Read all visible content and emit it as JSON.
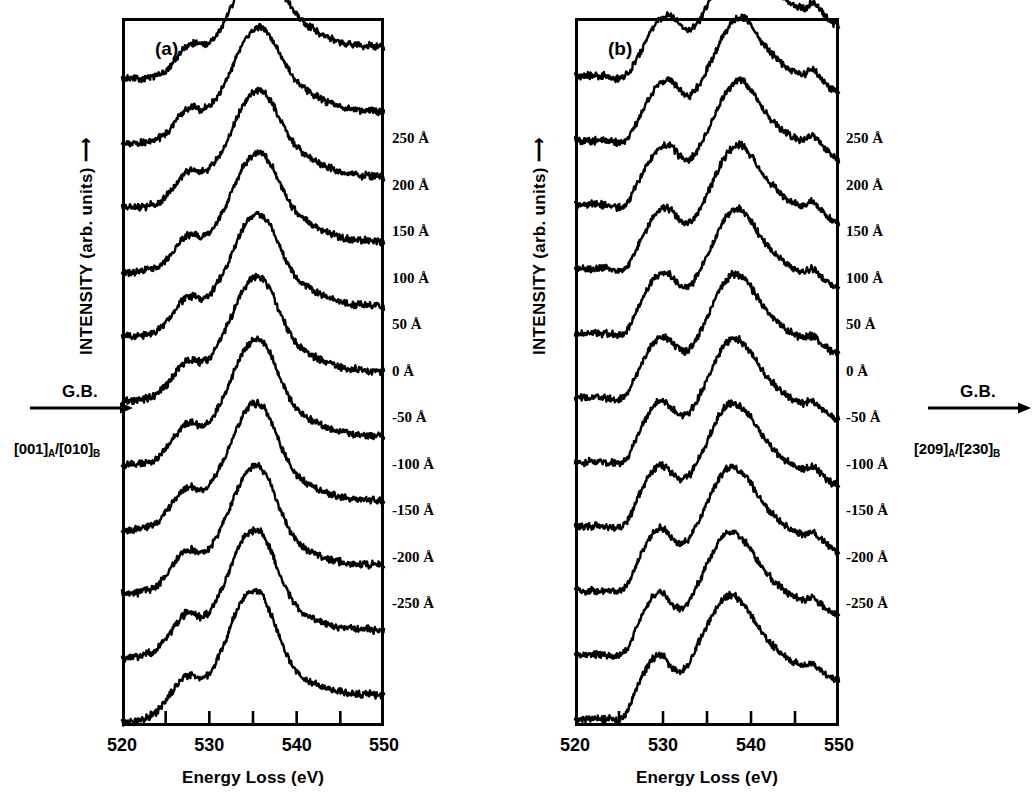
{
  "figure": {
    "type": "eels-spectra-figure",
    "background": "#ffffff",
    "line_color": "#000000"
  },
  "panels": [
    {
      "id": "a",
      "letter": "(a)",
      "y_axis_label": "INTENSITY (arb. units) ⟶",
      "x_axis_title": "Energy Loss  (eV)",
      "gb_label": "G.B.",
      "orientation_prefix": "[001]",
      "orientation_sub_a": "A",
      "orientation_separator": "/",
      "orientation_suffix": "[010]",
      "orientation_sub_b": "B",
      "orientation_full": "[001]A/[010]B",
      "x_tick_labels": [
        "520",
        "530",
        "540",
        "550"
      ],
      "x_tick_label_values": [
        520,
        530,
        540,
        550
      ],
      "x_minor_ticks": [
        525,
        530,
        535,
        540,
        545
      ],
      "depth_labels": [
        "250 Å",
        "200 Å",
        "150 Å",
        "100 Å",
        "50 Å",
        "0 Å",
        "-50 Å",
        "-100 Å",
        "-150 Å",
        "-200 Å",
        "-250 Å"
      ]
    },
    {
      "id": "b",
      "letter": "(b)",
      "y_axis_label": "INTENSITY (arb. units) ⟶",
      "x_axis_title": "Energy Loss  (eV)",
      "gb_label": "G.B.",
      "orientation_prefix": "[209]",
      "orientation_sub_a": "A",
      "orientation_separator": "/",
      "orientation_suffix": "[230]",
      "orientation_sub_b": "B",
      "orientation_full": "[209]A/[230]B",
      "x_tick_labels": [
        "520",
        "530",
        "540",
        "550"
      ],
      "x_tick_label_values": [
        520,
        530,
        540,
        550
      ],
      "x_minor_ticks": [
        525,
        530,
        535,
        540,
        545
      ],
      "depth_labels": [
        "250 Å",
        "200 Å",
        "150 Å",
        "100 Å",
        "50 Å",
        "0 Å",
        "-50 Å",
        "-100 Å",
        "-150 Å",
        "-200 Å",
        "-250 Å"
      ]
    }
  ],
  "chart_data": [
    {
      "type": "line",
      "panel": "a",
      "title": "(a) [001]A/[010]B",
      "xlabel": "Energy Loss  (eV)",
      "ylabel": "INTENSITY (arb. units)",
      "xlim": [
        520,
        550
      ],
      "ylim": [
        0,
        11
      ],
      "grid": false,
      "legend": "right-side depth labels",
      "stacked_offset": true,
      "x": [
        520,
        521,
        522,
        523,
        524,
        525,
        526,
        527,
        528,
        529,
        530,
        531,
        532,
        533,
        534,
        535,
        536,
        537,
        538,
        539,
        540,
        541,
        542,
        543,
        544,
        545,
        546,
        547,
        548,
        549,
        550
      ],
      "series": [
        {
          "name": "250 Å",
          "offset": 10,
          "values": [
            0.05,
            0.06,
            0.05,
            0.07,
            0.1,
            0.18,
            0.34,
            0.52,
            0.6,
            0.58,
            0.62,
            0.78,
            1.02,
            1.32,
            1.62,
            1.82,
            1.9,
            1.78,
            1.52,
            1.26,
            1.06,
            0.92,
            0.82,
            0.74,
            0.68,
            0.63,
            0.6,
            0.58,
            0.57,
            0.56,
            0.55
          ]
        },
        {
          "name": "200 Å",
          "offset": 9,
          "values": [
            0.05,
            0.05,
            0.06,
            0.08,
            0.11,
            0.2,
            0.36,
            0.54,
            0.62,
            0.58,
            0.64,
            0.8,
            1.04,
            1.36,
            1.64,
            1.8,
            1.86,
            1.7,
            1.46,
            1.22,
            1.02,
            0.9,
            0.8,
            0.73,
            0.67,
            0.62,
            0.59,
            0.57,
            0.56,
            0.55,
            0.54
          ]
        },
        {
          "name": "150 Å",
          "offset": 8,
          "values": [
            0.05,
            0.06,
            0.06,
            0.08,
            0.12,
            0.22,
            0.38,
            0.56,
            0.63,
            0.6,
            0.66,
            0.84,
            1.08,
            1.4,
            1.68,
            1.84,
            1.88,
            1.72,
            1.46,
            1.2,
            1.0,
            0.88,
            0.79,
            0.72,
            0.66,
            0.61,
            0.58,
            0.56,
            0.55,
            0.54,
            0.53
          ]
        },
        {
          "name": "100 Å",
          "offset": 7,
          "values": [
            0.05,
            0.05,
            0.06,
            0.09,
            0.13,
            0.24,
            0.4,
            0.58,
            0.64,
            0.6,
            0.66,
            0.86,
            1.12,
            1.44,
            1.72,
            1.88,
            1.9,
            1.74,
            1.46,
            1.18,
            0.98,
            0.86,
            0.77,
            0.7,
            0.65,
            0.6,
            0.57,
            0.55,
            0.54,
            0.53,
            0.52
          ]
        },
        {
          "name": "50 Å",
          "offset": 6,
          "values": [
            0.05,
            0.06,
            0.06,
            0.09,
            0.14,
            0.26,
            0.44,
            0.62,
            0.68,
            0.64,
            0.7,
            0.9,
            1.16,
            1.48,
            1.76,
            1.92,
            1.94,
            1.76,
            1.46,
            1.18,
            0.96,
            0.84,
            0.76,
            0.69,
            0.64,
            0.59,
            0.56,
            0.55,
            0.54,
            0.53,
            0.52
          ]
        },
        {
          "name": "0 Å",
          "offset": 5,
          "values": [
            0.05,
            0.05,
            0.07,
            0.1,
            0.15,
            0.28,
            0.46,
            0.64,
            0.7,
            0.66,
            0.72,
            0.94,
            1.2,
            1.52,
            1.8,
            1.96,
            1.96,
            1.78,
            1.46,
            1.16,
            0.94,
            0.82,
            0.74,
            0.68,
            0.63,
            0.58,
            0.56,
            0.54,
            0.53,
            0.52,
            0.51
          ]
        },
        {
          "name": "-50 Å",
          "offset": 4,
          "values": [
            0.05,
            0.06,
            0.07,
            0.1,
            0.16,
            0.3,
            0.48,
            0.66,
            0.72,
            0.66,
            0.72,
            0.94,
            1.22,
            1.56,
            1.84,
            1.98,
            1.98,
            1.78,
            1.44,
            1.14,
            0.92,
            0.8,
            0.72,
            0.66,
            0.61,
            0.57,
            0.55,
            0.53,
            0.52,
            0.51,
            0.5
          ]
        },
        {
          "name": "-100 Å",
          "offset": 3,
          "values": [
            0.05,
            0.05,
            0.07,
            0.11,
            0.17,
            0.32,
            0.5,
            0.68,
            0.72,
            0.66,
            0.74,
            0.96,
            1.24,
            1.58,
            1.86,
            2.0,
            1.98,
            1.76,
            1.42,
            1.12,
            0.9,
            0.78,
            0.7,
            0.64,
            0.6,
            0.56,
            0.54,
            0.52,
            0.51,
            0.5,
            0.5
          ]
        },
        {
          "name": "-150 Å",
          "offset": 2,
          "values": [
            0.05,
            0.06,
            0.08,
            0.12,
            0.18,
            0.34,
            0.52,
            0.7,
            0.74,
            0.68,
            0.76,
            0.98,
            1.28,
            1.62,
            1.9,
            2.02,
            2.0,
            1.76,
            1.4,
            1.1,
            0.88,
            0.76,
            0.68,
            0.62,
            0.58,
            0.55,
            0.53,
            0.52,
            0.51,
            0.5,
            0.49
          ]
        },
        {
          "name": "-200 Å",
          "offset": 1,
          "values": [
            0.05,
            0.06,
            0.08,
            0.12,
            0.19,
            0.36,
            0.54,
            0.72,
            0.76,
            0.7,
            0.78,
            1.02,
            1.32,
            1.66,
            1.94,
            2.04,
            2.0,
            1.74,
            1.38,
            1.08,
            0.86,
            0.74,
            0.67,
            0.61,
            0.57,
            0.54,
            0.52,
            0.51,
            0.5,
            0.49,
            0.49
          ]
        },
        {
          "name": "-250 Å",
          "offset": 0,
          "values": [
            0.05,
            0.07,
            0.09,
            0.14,
            0.22,
            0.4,
            0.58,
            0.76,
            0.8,
            0.74,
            0.82,
            1.06,
            1.38,
            1.74,
            2.0,
            2.1,
            2.04,
            1.76,
            1.38,
            1.06,
            0.84,
            0.72,
            0.65,
            0.6,
            0.56,
            0.53,
            0.51,
            0.5,
            0.49,
            0.48,
            0.48
          ]
        }
      ]
    },
    {
      "type": "line",
      "panel": "b",
      "title": "(b) [209]A/[230]B",
      "xlabel": "Energy Loss  (eV)",
      "ylabel": "INTENSITY (arb. units)",
      "xlim": [
        520,
        550
      ],
      "ylim": [
        0,
        11
      ],
      "grid": false,
      "legend": "right-side depth labels",
      "stacked_offset": true,
      "x": [
        520,
        521,
        522,
        523,
        524,
        525,
        526,
        527,
        528,
        529,
        530,
        531,
        532,
        533,
        534,
        535,
        536,
        537,
        538,
        539,
        540,
        541,
        542,
        543,
        544,
        545,
        546,
        547,
        548,
        549,
        550
      ],
      "series": [
        {
          "name": "250 Å",
          "offset": 10,
          "values": [
            0.1,
            0.09,
            0.11,
            0.1,
            0.08,
            0.06,
            0.14,
            0.36,
            0.62,
            0.86,
            1.0,
            1.02,
            0.88,
            0.82,
            0.94,
            1.18,
            1.46,
            1.74,
            1.94,
            2.02,
            1.92,
            1.72,
            1.54,
            1.4,
            1.28,
            1.2,
            1.14,
            1.22,
            1.1,
            0.96,
            0.88
          ]
        },
        {
          "name": "200 Å",
          "offset": 9,
          "values": [
            0.1,
            0.1,
            0.09,
            0.11,
            0.09,
            0.06,
            0.14,
            0.38,
            0.64,
            0.88,
            1.02,
            1.02,
            0.86,
            0.8,
            0.94,
            1.2,
            1.48,
            1.76,
            1.96,
            2.02,
            1.9,
            1.68,
            1.5,
            1.36,
            1.24,
            1.16,
            1.12,
            1.2,
            1.06,
            0.92,
            0.84
          ]
        },
        {
          "name": "150 Å",
          "offset": 8,
          "values": [
            0.1,
            0.09,
            0.1,
            0.1,
            0.08,
            0.06,
            0.15,
            0.4,
            0.66,
            0.9,
            1.02,
            1.0,
            0.84,
            0.8,
            0.96,
            1.22,
            1.52,
            1.8,
            1.98,
            2.02,
            1.88,
            1.66,
            1.48,
            1.34,
            1.22,
            1.14,
            1.1,
            1.18,
            1.04,
            0.9,
            0.82
          ]
        },
        {
          "name": "100 Å",
          "offset": 7,
          "values": [
            0.1,
            0.1,
            0.1,
            0.11,
            0.09,
            0.07,
            0.16,
            0.42,
            0.68,
            0.92,
            1.04,
            1.0,
            0.84,
            0.82,
            0.98,
            1.26,
            1.56,
            1.84,
            2.0,
            2.02,
            1.86,
            1.64,
            1.46,
            1.32,
            1.2,
            1.12,
            1.08,
            1.14,
            1.02,
            0.88,
            0.8
          ]
        },
        {
          "name": "50 Å",
          "offset": 6,
          "values": [
            0.1,
            0.09,
            0.11,
            0.1,
            0.09,
            0.07,
            0.17,
            0.44,
            0.72,
            0.94,
            1.04,
            0.98,
            0.84,
            0.84,
            1.02,
            1.3,
            1.6,
            1.88,
            2.02,
            2.0,
            1.84,
            1.62,
            1.44,
            1.3,
            1.18,
            1.1,
            1.06,
            1.1,
            0.98,
            0.86,
            0.78
          ]
        },
        {
          "name": "0 Å",
          "offset": 5,
          "values": [
            0.1,
            0.1,
            0.1,
            0.11,
            0.09,
            0.08,
            0.18,
            0.46,
            0.74,
            0.96,
            1.04,
            0.96,
            0.84,
            0.86,
            1.06,
            1.34,
            1.64,
            1.9,
            2.02,
            1.98,
            1.82,
            1.6,
            1.42,
            1.28,
            1.16,
            1.08,
            1.04,
            1.06,
            0.96,
            0.84,
            0.78
          ]
        },
        {
          "name": "-50 Å",
          "offset": 4,
          "values": [
            0.1,
            0.09,
            0.11,
            0.1,
            0.1,
            0.08,
            0.19,
            0.48,
            0.76,
            0.98,
            1.04,
            0.94,
            0.84,
            0.88,
            1.1,
            1.38,
            1.68,
            1.92,
            2.02,
            1.96,
            1.8,
            1.58,
            1.4,
            1.26,
            1.14,
            1.06,
            1.02,
            1.04,
            0.94,
            0.82,
            0.76
          ]
        },
        {
          "name": "-100 Å",
          "offset": 3,
          "values": [
            0.1,
            0.1,
            0.1,
            0.11,
            0.1,
            0.09,
            0.2,
            0.5,
            0.78,
            1.0,
            1.04,
            0.92,
            0.84,
            0.9,
            1.14,
            1.42,
            1.72,
            1.94,
            2.02,
            1.94,
            1.78,
            1.56,
            1.38,
            1.24,
            1.12,
            1.04,
            1.0,
            1.02,
            0.92,
            0.8,
            0.74
          ]
        },
        {
          "name": "-150 Å",
          "offset": 2,
          "values": [
            0.1,
            0.09,
            0.11,
            0.1,
            0.1,
            0.09,
            0.21,
            0.52,
            0.8,
            1.02,
            1.06,
            0.92,
            0.84,
            0.92,
            1.18,
            1.46,
            1.74,
            1.96,
            2.02,
            1.92,
            1.76,
            1.54,
            1.36,
            1.22,
            1.1,
            1.02,
            0.98,
            1.0,
            0.9,
            0.78,
            0.72
          ]
        },
        {
          "name": "-200 Å",
          "offset": 1,
          "values": [
            0.1,
            0.1,
            0.11,
            0.11,
            0.1,
            0.1,
            0.22,
            0.54,
            0.82,
            1.04,
            1.06,
            0.9,
            0.84,
            0.94,
            1.22,
            1.5,
            1.78,
            1.98,
            2.02,
            1.9,
            1.74,
            1.52,
            1.34,
            1.2,
            1.08,
            1.0,
            0.96,
            0.98,
            0.88,
            0.78,
            0.72
          ]
        },
        {
          "name": "-250 Å",
          "offset": 0,
          "values": [
            0.1,
            0.1,
            0.12,
            0.11,
            0.11,
            0.1,
            0.24,
            0.58,
            0.86,
            1.06,
            1.08,
            0.9,
            0.86,
            0.98,
            1.28,
            1.56,
            1.82,
            2.0,
            2.04,
            1.9,
            1.72,
            1.5,
            1.32,
            1.18,
            1.06,
            0.98,
            0.94,
            0.96,
            0.86,
            0.76,
            0.7
          ]
        }
      ]
    }
  ]
}
